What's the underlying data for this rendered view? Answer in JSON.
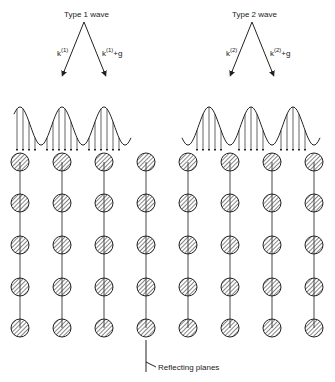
{
  "diagram": {
    "waves": [
      {
        "title": "Type 1 wave",
        "incident_label": "k",
        "incident_sup": "(1)",
        "diffracted_label": "k",
        "diffracted_sup": "(1)",
        "diffracted_suffix": "+g",
        "profile": "cos-squared peaks centered on atoms"
      },
      {
        "title": "Type 2 wave",
        "incident_label": "k",
        "incident_sup": "(2)",
        "diffracted_label": "k",
        "diffracted_sup": "(2)",
        "diffracted_suffix": "+g",
        "profile": "sin-squared peaks between atoms"
      }
    ],
    "lattice": {
      "columns_per_block": 4,
      "rows": 5,
      "atom_style": "hatched circle"
    },
    "annotation": "Reflecting planes",
    "colors": {
      "ink": "#222222",
      "background": "#ffffff"
    }
  }
}
